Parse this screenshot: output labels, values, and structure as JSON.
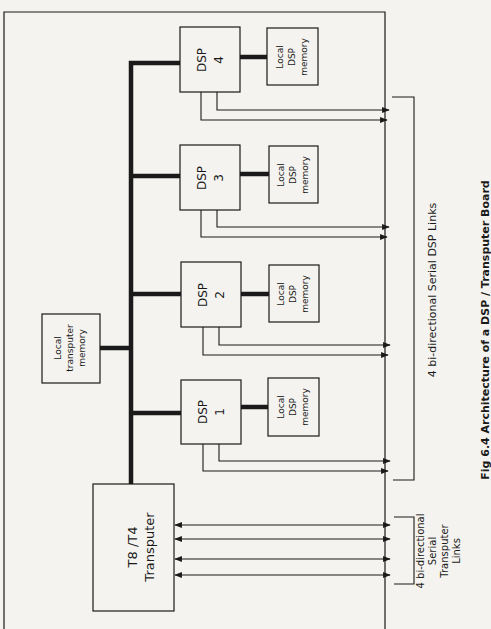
{
  "caption": "Fig 6.4 Architecture of a DSP / Transputer Board",
  "transputer": {
    "line1": "T8 /T4",
    "line2": "Transputer"
  },
  "transputer_memory": {
    "line1": "Local",
    "line2": "transputer",
    "line3": "memory"
  },
  "dsps": [
    {
      "line1": "DSP",
      "line2": "4",
      "mem": [
        "Local",
        "DSP",
        "memory"
      ]
    },
    {
      "line1": "DSP",
      "line2": "3",
      "mem": [
        "Local",
        "DSP",
        "memory"
      ]
    },
    {
      "line1": "DSP",
      "line2": "2",
      "mem": [
        "Local",
        "DSP",
        "memory"
      ]
    },
    {
      "line1": "DSP",
      "line2": "1",
      "mem": [
        "Local",
        "DSP",
        "memory"
      ]
    }
  ],
  "dsp_links_label": "4 bi-directional Serial DSP Links",
  "transputer_links_label": {
    "line1": "4 bi-directional",
    "line2": "Serial",
    "line3": "Transputer",
    "line4": "Links"
  },
  "colors": {
    "ink": "#1a1a1a",
    "paper": "#f4f3ef"
  }
}
